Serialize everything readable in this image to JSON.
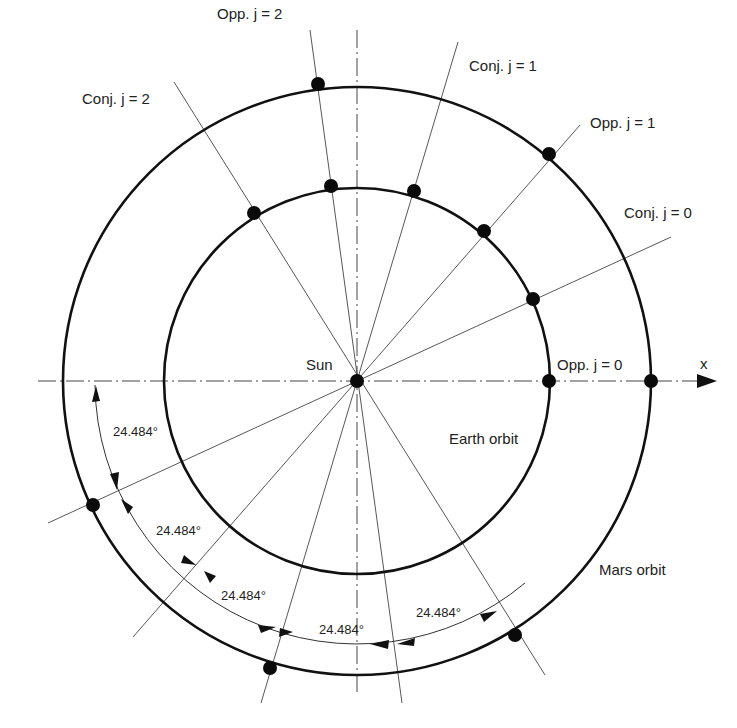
{
  "figure": {
    "center": {
      "x": 357,
      "y": 381
    },
    "earth_radius": 193,
    "mars_radius": 292,
    "dim_radius": 262,
    "step_angle_deg": 24.484,
    "colors": {
      "ink": "#111111",
      "background": "#ffffff",
      "thin_line": "#444444"
    }
  },
  "labels": {
    "sun": "Sun",
    "x_axis": "x",
    "earth_orbit": "Earth orbit",
    "mars_orbit": "Mars orbit",
    "opp_j0": "Opp.  j = 0",
    "conj_j0": "Conj.  j = 0",
    "opp_j1": "Opp.  j = 1",
    "conj_j1": "Conj.  j = 1",
    "opp_j2": "Opp.  j = 2",
    "conj_j2": "Conj.  j = 2"
  },
  "angle_labels": [
    "24.484°",
    "24.484°",
    "24.484°",
    "24.484°",
    "24.484°"
  ],
  "rays": [
    {
      "name": "opp-j0",
      "angle_deg": 0,
      "event": "Opposition",
      "j": 0
    },
    {
      "name": "conj-j0",
      "angle_deg": 24.484,
      "event": "Conjunction",
      "j": 0
    },
    {
      "name": "opp-j1",
      "angle_deg": 48.968,
      "event": "Opposition",
      "j": 1
    },
    {
      "name": "conj-j1",
      "angle_deg": 73.452,
      "event": "Conjunction",
      "j": 1
    },
    {
      "name": "opp-j2",
      "angle_deg": 97.936,
      "event": "Opposition",
      "j": 2
    },
    {
      "name": "conj-j2",
      "angle_deg": 122.42,
      "event": "Conjunction",
      "j": 2
    }
  ]
}
